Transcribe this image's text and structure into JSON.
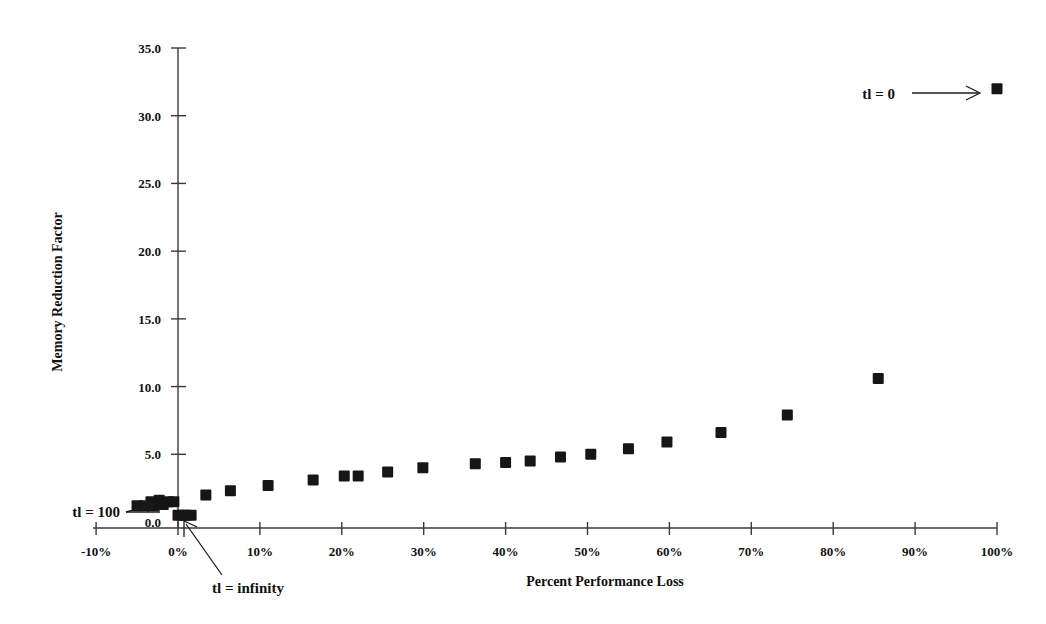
{
  "chart_data": {
    "type": "scatter",
    "title": "",
    "xlabel": "Percent Performance Loss",
    "ylabel": "Memory Reduction Factor",
    "xlim": [
      -10,
      100
    ],
    "ylim": [
      0.0,
      35.0
    ],
    "grid": false,
    "legend": "none",
    "x_tick_labels": [
      "-10%",
      "0%",
      "10%",
      "20%",
      "30%",
      "40%",
      "50%",
      "60%",
      "70%",
      "80%",
      "90%",
      "100%"
    ],
    "x_tick_values": [
      -10,
      0,
      10,
      20,
      30,
      40,
      50,
      60,
      70,
      80,
      90,
      100
    ],
    "y_tick_labels": [
      "0.0",
      "5.0",
      "10.0",
      "15.0",
      "20.0",
      "25.0",
      "30.0",
      "35.0"
    ],
    "y_tick_values": [
      0.0,
      5.0,
      10.0,
      15.0,
      20.0,
      25.0,
      30.0,
      35.0
    ],
    "series": [
      {
        "name": "memory reduction vs performance loss",
        "marker": "filled-square",
        "color": "#161616",
        "points": [
          {
            "x": -5.0,
            "y": 1.2
          },
          {
            "x": -4.1,
            "y": 1.2
          },
          {
            "x": -3.3,
            "y": 1.5
          },
          {
            "x": -2.9,
            "y": 1.2
          },
          {
            "x": -2.3,
            "y": 1.6
          },
          {
            "x": -1.8,
            "y": 1.3
          },
          {
            "x": -1.2,
            "y": 1.5
          },
          {
            "x": -0.5,
            "y": 1.5
          },
          {
            "x": 0.0,
            "y": 0.5
          },
          {
            "x": 0.5,
            "y": 0.5
          },
          {
            "x": 1.0,
            "y": 0.5
          },
          {
            "x": 1.6,
            "y": 0.5
          },
          {
            "x": 3.4,
            "y": 2.0
          },
          {
            "x": 6.4,
            "y": 2.3
          },
          {
            "x": 11.0,
            "y": 2.7
          },
          {
            "x": 16.5,
            "y": 3.1
          },
          {
            "x": 20.3,
            "y": 3.4
          },
          {
            "x": 22.0,
            "y": 3.4
          },
          {
            "x": 25.6,
            "y": 3.7
          },
          {
            "x": 29.9,
            "y": 4.0
          },
          {
            "x": 36.3,
            "y": 4.3
          },
          {
            "x": 40.0,
            "y": 4.4
          },
          {
            "x": 43.0,
            "y": 4.5
          },
          {
            "x": 46.7,
            "y": 4.8
          },
          {
            "x": 50.4,
            "y": 5.0
          },
          {
            "x": 55.0,
            "y": 5.4
          },
          {
            "x": 59.7,
            "y": 5.9
          },
          {
            "x": 66.3,
            "y": 6.6
          },
          {
            "x": 74.4,
            "y": 7.9
          },
          {
            "x": 85.5,
            "y": 10.6
          },
          {
            "x": 100.0,
            "y": 32.0
          }
        ]
      }
    ],
    "annotations": [
      {
        "id": "tl-zero",
        "text": "tl = 0",
        "target_x": 100.0,
        "target_y": 32.0
      },
      {
        "id": "tl-hundred",
        "text": "tl = 100",
        "target_x": -3.0,
        "target_y": 1.3
      },
      {
        "id": "tl-infinity",
        "text": "tl = infinity",
        "target_x": 0.6,
        "target_y": 0.5
      }
    ]
  },
  "axes": {
    "x_title": "Percent Performance Loss",
    "y_title": "Memory Reduction Factor"
  },
  "annotation_labels": {
    "tl_zero": "tl = 0",
    "tl_hundred": "tl = 100",
    "tl_infinity": "tl = infinity"
  }
}
